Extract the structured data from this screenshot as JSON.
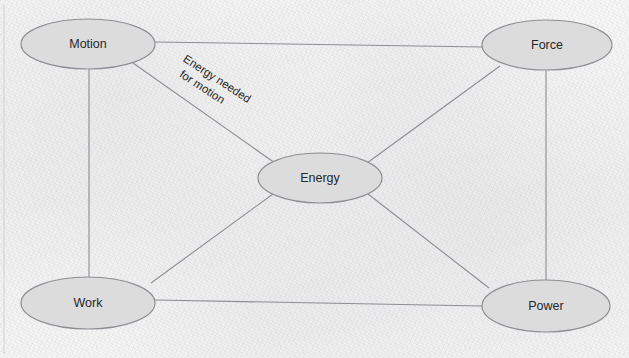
{
  "diagram": {
    "background_color": "#f3f3f3",
    "node_fill_color": "#dcdcdc",
    "node_stroke_color": "#8e8e94",
    "edge_stroke_color": "#8d8d93",
    "label_color": "#27272b",
    "nodes": [
      {
        "id": "motion",
        "label": "Motion",
        "cx": 88,
        "cy": 44,
        "rx": 67,
        "ry": 25
      },
      {
        "id": "force",
        "label": "Force",
        "cx": 547,
        "cy": 45,
        "rx": 65,
        "ry": 25
      },
      {
        "id": "energy",
        "label": "Energy",
        "cx": 320,
        "cy": 178,
        "rx": 62,
        "ry": 25
      },
      {
        "id": "work",
        "label": "Work",
        "cx": 88,
        "cy": 303,
        "rx": 67,
        "ry": 26
      },
      {
        "id": "power",
        "label": "Power",
        "cx": 546,
        "cy": 306,
        "rx": 64,
        "ry": 26
      }
    ],
    "edges": [
      {
        "id": "motion-force",
        "from": "motion",
        "to": "force",
        "x1": 155,
        "y1": 42,
        "x2": 483,
        "y2": 47,
        "label": ""
      },
      {
        "id": "motion-energy",
        "from": "motion",
        "to": "energy",
        "x1": 133,
        "y1": 63,
        "x2": 275,
        "y2": 163,
        "label": "Energy needed for motion"
      },
      {
        "id": "motion-work",
        "from": "motion",
        "to": "work",
        "x1": 89,
        "y1": 69,
        "x2": 89,
        "y2": 277,
        "label": ""
      },
      {
        "id": "force-energy",
        "from": "force",
        "to": "energy",
        "x1": 500,
        "y1": 66,
        "x2": 367,
        "y2": 163,
        "label": ""
      },
      {
        "id": "force-power",
        "from": "force",
        "to": "power",
        "x1": 546,
        "y1": 70,
        "x2": 546,
        "y2": 280,
        "label": ""
      },
      {
        "id": "energy-work",
        "from": "energy",
        "to": "work",
        "x1": 273,
        "y1": 194,
        "x2": 151,
        "y2": 283,
        "label": ""
      },
      {
        "id": "energy-power",
        "from": "energy",
        "to": "power",
        "x1": 368,
        "y1": 194,
        "x2": 489,
        "y2": 288,
        "label": ""
      },
      {
        "id": "work-power",
        "from": "work",
        "to": "power",
        "x1": 155,
        "y1": 300,
        "x2": 482,
        "y2": 306,
        "label": ""
      }
    ],
    "edge_labels": [
      {
        "id": "energy-needed-for-motion",
        "line1": "Energy needed",
        "line2": "for motion",
        "x": 215,
        "y": 82,
        "rotation": 33
      }
    ],
    "frame": {
      "left_border_x": 4,
      "top": 6,
      "bottom": 352
    }
  }
}
